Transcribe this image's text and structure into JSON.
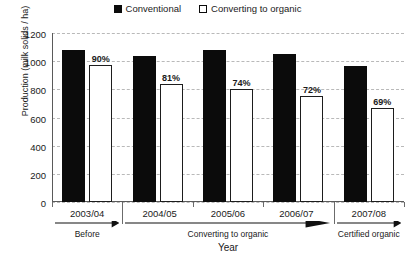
{
  "chart_data": {
    "type": "bar",
    "title": "",
    "xlabel": "Year",
    "ylabel": "Production (milk solids / ha)",
    "categories": [
      "2003/04",
      "2004/05",
      "2005/06",
      "2006/07",
      "2007/08"
    ],
    "series": [
      {
        "name": "Conventional",
        "values": [
          1080,
          1040,
          1080,
          1050,
          965
        ],
        "color": "#0b0b0b"
      },
      {
        "name": "Converting to organic",
        "values": [
          970,
          840,
          800,
          755,
          670
        ],
        "color": "#ffffff"
      }
    ],
    "point_labels": [
      "90%",
      "81%",
      "74%",
      "72%",
      "69%"
    ],
    "ylim": [
      0,
      1200
    ],
    "yticks": [
      0,
      200,
      400,
      600,
      800,
      1000,
      1200
    ],
    "ytick_labels": [
      "0",
      "200",
      "400",
      "600",
      "800",
      "1000",
      "1200"
    ],
    "grid": true,
    "legend_position": "top-center",
    "phases": [
      {
        "name": "Before",
        "years": [
          "2003/04"
        ]
      },
      {
        "name": "Converting to organic",
        "years": [
          "2004/05",
          "2005/06",
          "2006/07"
        ]
      },
      {
        "name": "Certified organic",
        "years": [
          "2007/08"
        ]
      }
    ]
  },
  "legend": {
    "entries": [
      {
        "label": "Conventional",
        "marker": "filled-square-icon"
      },
      {
        "label": "Converting to organic",
        "marker": "hollow-square-icon"
      }
    ]
  }
}
